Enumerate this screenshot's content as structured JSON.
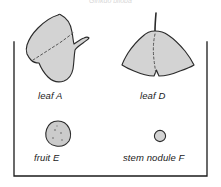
{
  "figure": {
    "header_caption": "Ginkgo biloba",
    "background_color": "#ffffff",
    "frame": {
      "stroke_color": "#1b1b1b",
      "stroke_width": 1.2,
      "style": "open-top bracket box"
    },
    "specimen_fill_color": "#d3d3d3",
    "specimen_stroke_color": "#2b2b2b",
    "dashed_line_color": "#4a4a4a",
    "specimens": [
      {
        "id": "A",
        "label": "leaf A",
        "kind": "leaf",
        "position": "top-left",
        "has_dashed_midline": true
      },
      {
        "id": "D",
        "label": "leaf D",
        "kind": "leaf",
        "position": "top-right",
        "has_dashed_midline": true,
        "has_stem": true,
        "has_basal_notch": true
      },
      {
        "id": "E",
        "label": "fruit E",
        "kind": "fruit",
        "position": "bottom-left",
        "has_stipple_texture": true
      },
      {
        "id": "F",
        "label": "stem nodule F",
        "kind": "stem nodule",
        "position": "bottom-right",
        "shape": "small circle"
      }
    ]
  }
}
